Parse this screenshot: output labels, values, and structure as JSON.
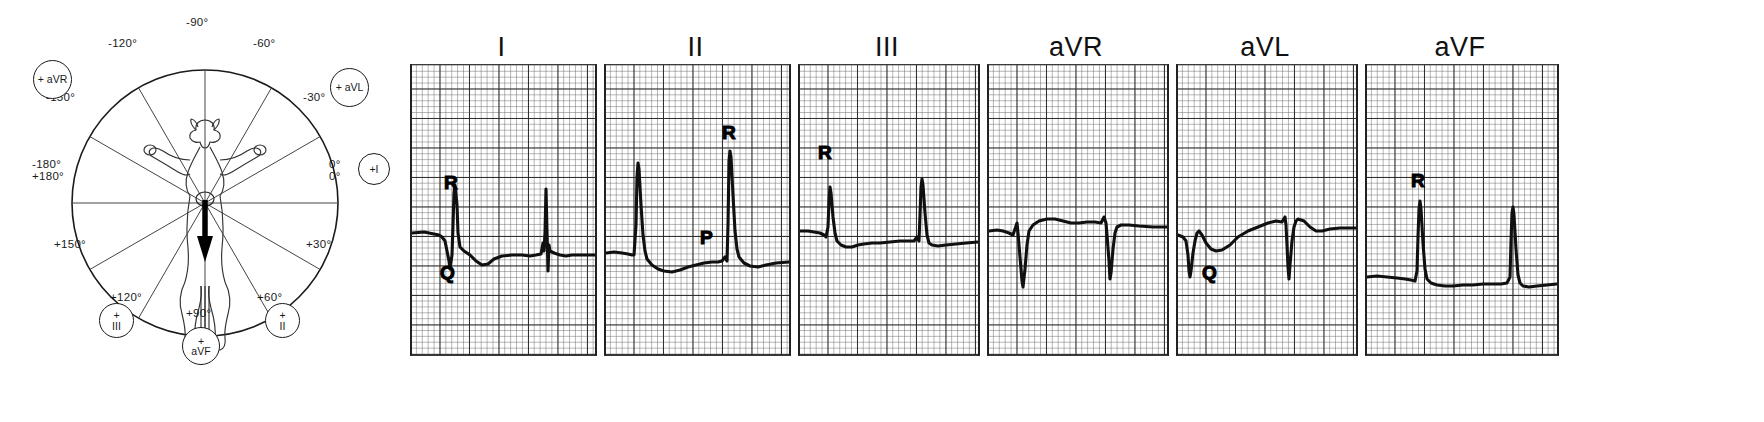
{
  "figure": {
    "type": "hexaxial-reference-system-with-ecg-leads",
    "axis_diagram": {
      "name": "hexaxial-reference-circle",
      "center_subject": "dog-torso-outline-with-mean-electrical-axis-arrow",
      "arrow_direction_deg": 90,
      "degree_labels": [
        {
          "id": "neg90",
          "text": "-90°"
        },
        {
          "id": "neg120",
          "text": "-120°"
        },
        {
          "id": "neg60",
          "text": "-60°"
        },
        {
          "id": "neg150",
          "text": "-150°"
        },
        {
          "id": "neg30",
          "text": "-30°"
        },
        {
          "id": "pm180",
          "text": "-180°\n+180°"
        },
        {
          "id": "zero",
          "text": "0°\n0°"
        },
        {
          "id": "pos150",
          "text": "+150°"
        },
        {
          "id": "pos30",
          "text": "+30°"
        },
        {
          "id": "pos120",
          "text": "+120°"
        },
        {
          "id": "pos60",
          "text": "+60°"
        },
        {
          "id": "pos90",
          "text": "+90°"
        }
      ],
      "lead_circles": [
        {
          "id": "avr",
          "text": "+ aVR",
          "angle_deg": -150
        },
        {
          "id": "avl",
          "text": "+ aVL",
          "angle_deg": -30
        },
        {
          "id": "i",
          "text": "+I",
          "angle_deg": 0
        },
        {
          "id": "ii",
          "text": "+\nII",
          "angle_deg": 60
        },
        {
          "id": "iii",
          "text": "+\nIII",
          "angle_deg": 120
        },
        {
          "id": "avf",
          "text": "+\naVF",
          "angle_deg": 90
        }
      ]
    },
    "ecg_panels": [
      {
        "id": "lead-I",
        "label": "I",
        "annotations": [
          {
            "id": "I-R",
            "text": "R",
            "wave": "R"
          },
          {
            "id": "I-Q",
            "text": "Q",
            "wave": "Q"
          }
        ]
      },
      {
        "id": "lead-II",
        "label": "II",
        "annotations": [
          {
            "id": "II-P",
            "text": "P",
            "wave": "P"
          },
          {
            "id": "II-R",
            "text": "R",
            "wave": "R"
          }
        ]
      },
      {
        "id": "lead-III",
        "label": "III",
        "annotations": [
          {
            "id": "III-R",
            "text": "R",
            "wave": "R"
          }
        ]
      },
      {
        "id": "lead-aVR",
        "label": "aVR",
        "annotations": []
      },
      {
        "id": "lead-aVL",
        "label": "aVL",
        "annotations": [
          {
            "id": "aVL-Q",
            "text": "Q",
            "wave": "Q"
          }
        ]
      },
      {
        "id": "lead-aVF",
        "label": "aVF",
        "annotations": [
          {
            "id": "aVF-R",
            "text": "R",
            "wave": "R"
          }
        ]
      }
    ]
  },
  "colors": {
    "ink": "#101010",
    "grid_major": "#282828",
    "grid_minor": "#5f5f5f",
    "paper": "#ffffff"
  }
}
